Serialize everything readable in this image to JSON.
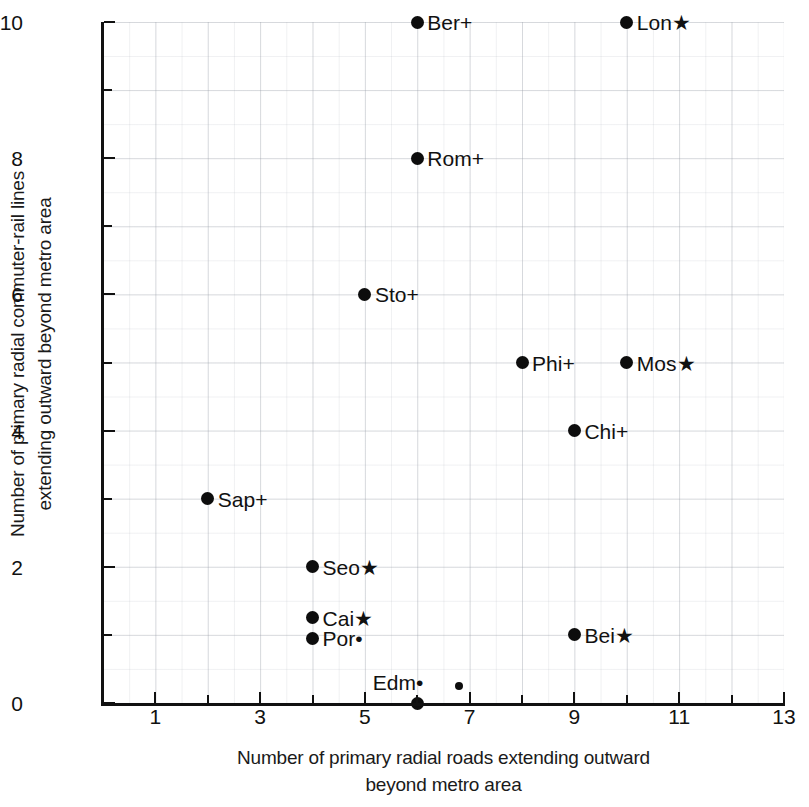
{
  "chart_data": {
    "type": "scatter",
    "title": "",
    "xlabel": "Number of primary radial roads extending outward beyond metro area",
    "xlabel_lines": [
      "Number of primary radial roads extending outward",
      "beyond metro area"
    ],
    "ylabel": "Number of primary radial commuter-rail lines extending outward beyond metro area",
    "ylabel_lines": [
      "Number of primary radial commuter-rail lines",
      "extending outward beyond metro area"
    ],
    "xlim": [
      0,
      13
    ],
    "ylim": [
      0,
      10
    ],
    "x_major_ticks": [
      1,
      3,
      5,
      7,
      9,
      11,
      13
    ],
    "x_minor_ticks": [
      2,
      4,
      6,
      8,
      10,
      12
    ],
    "y_major_ticks": [
      0,
      2,
      4,
      6,
      8,
      10
    ],
    "y_minor_ticks": [
      1,
      3,
      5,
      7,
      9
    ],
    "x_tick_labels": [
      "1",
      "3",
      "5",
      "7",
      "9",
      "11",
      "13"
    ],
    "y_tick_labels": [
      "0",
      "2",
      "4",
      "6",
      "8",
      "10"
    ],
    "grid": true,
    "grid_style": "faint graph paper, 0.5 unit spacing",
    "legend": "none",
    "marker_color": "#0d0d0d",
    "points": [
      {
        "label": "Ber+",
        "city": "Ber",
        "suffix": "+",
        "x": 6,
        "y": 10,
        "label_side": "right",
        "marker": "large"
      },
      {
        "label": "Lon★",
        "city": "Lon",
        "suffix": "★",
        "x": 10,
        "y": 10,
        "label_side": "right",
        "marker": "large"
      },
      {
        "label": "Rom+",
        "city": "Rom",
        "suffix": "+",
        "x": 6,
        "y": 8,
        "label_side": "right",
        "marker": "large"
      },
      {
        "label": "Sto+",
        "city": "Sto",
        "suffix": "+",
        "x": 5,
        "y": 6,
        "label_side": "right",
        "marker": "large"
      },
      {
        "label": "Phi+",
        "city": "Phi",
        "suffix": "+",
        "x": 8,
        "y": 5,
        "label_side": "right",
        "marker": "large"
      },
      {
        "label": "Mos★",
        "city": "Mos",
        "suffix": "★",
        "x": 10,
        "y": 5,
        "label_side": "right",
        "marker": "large"
      },
      {
        "label": "Chi+",
        "city": "Chi",
        "suffix": "+",
        "x": 9,
        "y": 4,
        "label_side": "right",
        "marker": "large"
      },
      {
        "label": "Sap+",
        "city": "Sap",
        "suffix": "+",
        "x": 2,
        "y": 3,
        "label_side": "right",
        "marker": "large"
      },
      {
        "label": "Seo★",
        "city": "Seo",
        "suffix": "★",
        "x": 4,
        "y": 2,
        "label_side": "right",
        "marker": "large"
      },
      {
        "label": "Cai★",
        "city": "Cai",
        "suffix": "★",
        "x": 4,
        "y": 1.25,
        "label_side": "right",
        "marker": "large"
      },
      {
        "label": "Por•",
        "city": "Por",
        "suffix": "•",
        "x": 4,
        "y": 0.95,
        "label_side": "right",
        "marker": "large"
      },
      {
        "label": "Edm•",
        "city": "Edm",
        "suffix": "•",
        "x": 6,
        "y": 0,
        "label_side": "above-left",
        "marker": "large"
      },
      {
        "label": "Bei★",
        "city": "Bei",
        "suffix": "★",
        "x": 9,
        "y": 1,
        "label_side": "right",
        "marker": "large"
      },
      {
        "label": "",
        "city": "",
        "suffix": "",
        "x": 6.8,
        "y": 0.25,
        "label_side": "none",
        "marker": "small"
      }
    ]
  },
  "axis": {
    "y_labels": [
      {
        "text": "10",
        "value": 10
      },
      {
        "text": "8",
        "value": 8
      },
      {
        "text": "6",
        "value": 6
      },
      {
        "text": "4",
        "value": 4
      },
      {
        "text": "2",
        "value": 2
      },
      {
        "text": "0",
        "value": 0
      }
    ],
    "x_labels": [
      {
        "text": "1",
        "value": 1
      },
      {
        "text": "3",
        "value": 3
      },
      {
        "text": "5",
        "value": 5
      },
      {
        "text": "7",
        "value": 7
      },
      {
        "text": "9",
        "value": 9
      },
      {
        "text": "11",
        "value": 11
      },
      {
        "text": "13",
        "value": 13
      }
    ]
  }
}
